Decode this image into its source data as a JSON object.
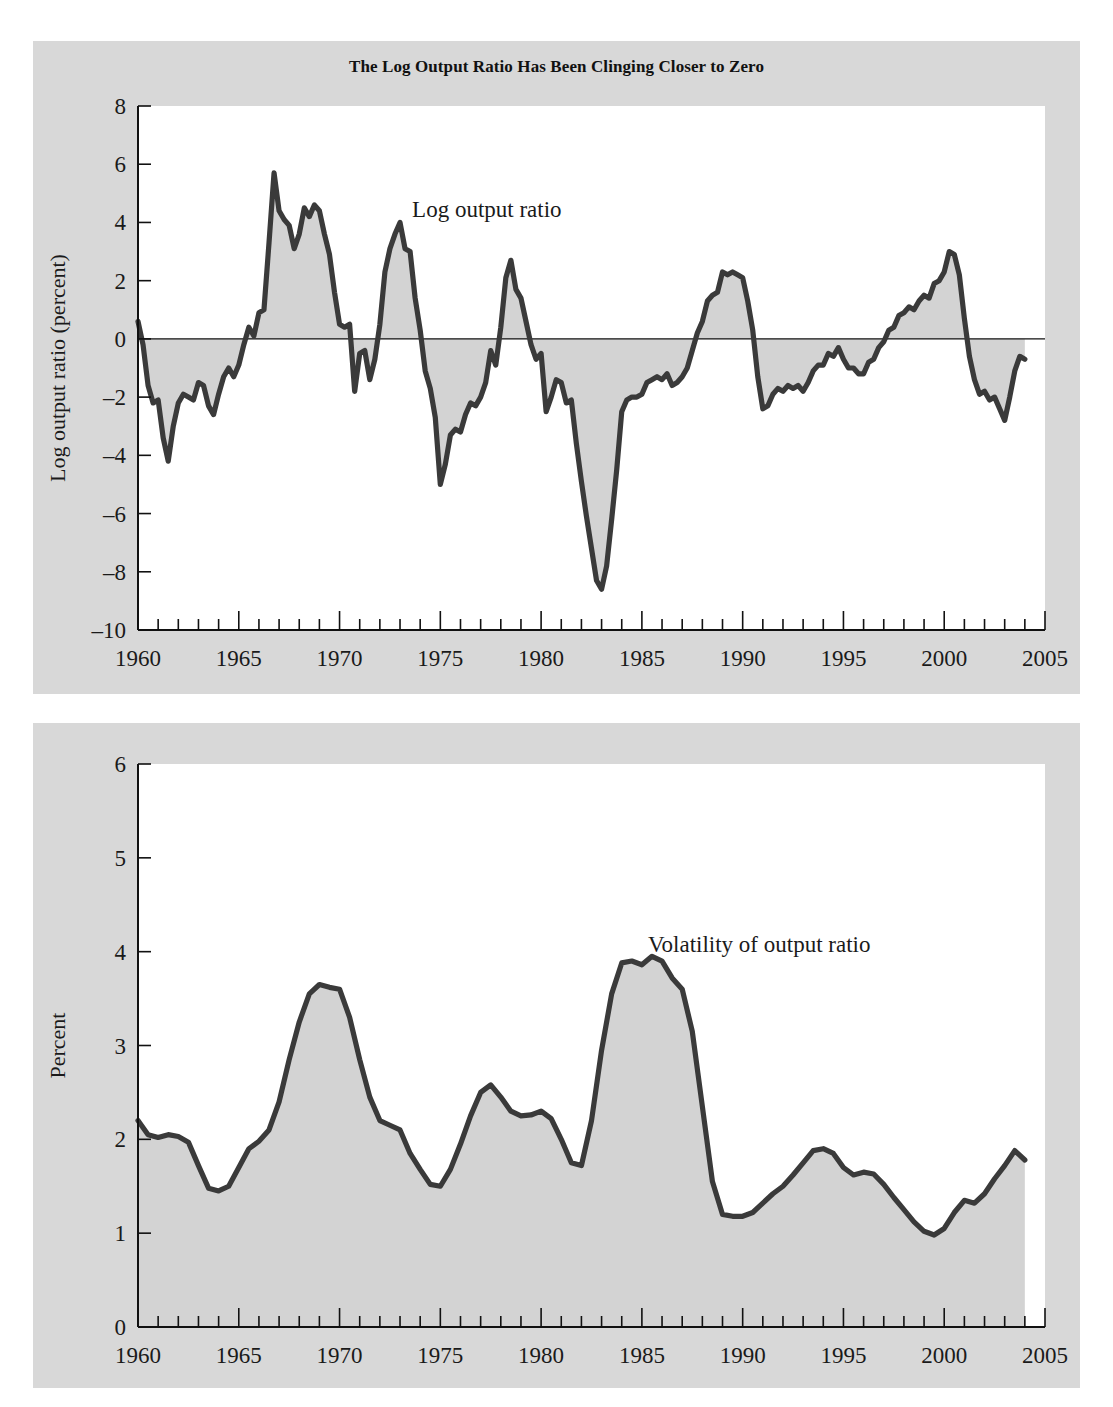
{
  "figure": {
    "title": "The Log Output Ratio Has Been Clinging Closer to Zero",
    "background_color": "#d8d8d8",
    "plot_background_color": "#ffffff",
    "line_color": "#3a3a3a",
    "fill_color": "#d3d3d3"
  },
  "chart_data": [
    {
      "type": "area",
      "title": "The Log Output Ratio Has Been Clinging Closer to Zero",
      "xlabel": "",
      "ylabel": "Log output ratio (percent)",
      "xlim": [
        1960,
        2005
      ],
      "ylim": [
        -10,
        8
      ],
      "ytick_labels": [
        "8",
        "6",
        "4",
        "2",
        "0",
        "-2",
        "-4",
        "-6",
        "-8",
        "-10"
      ],
      "yticks": [
        8,
        6,
        4,
        2,
        0,
        -2,
        -4,
        -6,
        -8,
        -10
      ],
      "xtick_labels": [
        "1960",
        "1965",
        "1970",
        "1975",
        "1980",
        "1985",
        "1990",
        "1995",
        "2000",
        "2005"
      ],
      "xticks": [
        1960,
        1965,
        1970,
        1975,
        1980,
        1985,
        1990,
        1995,
        2000,
        2005
      ],
      "minor_xtick_interval": 1,
      "grid": false,
      "legend": "none",
      "annotations": [
        {
          "text": "Log output ratio",
          "x": 1973.6,
          "y": 4.2
        }
      ],
      "baseline": 0,
      "series": [
        {
          "name": "Log output ratio",
          "x": [
            1960.0,
            1960.25,
            1960.5,
            1960.75,
            1961.0,
            1961.25,
            1961.5,
            1961.75,
            1962.0,
            1962.25,
            1962.5,
            1962.75,
            1963.0,
            1963.25,
            1963.5,
            1963.75,
            1964.0,
            1964.25,
            1964.5,
            1964.75,
            1965.0,
            1965.25,
            1965.5,
            1965.75,
            1966.0,
            1966.25,
            1966.5,
            1966.75,
            1967.0,
            1967.25,
            1967.5,
            1967.75,
            1968.0,
            1968.25,
            1968.5,
            1968.75,
            1969.0,
            1969.25,
            1969.5,
            1969.75,
            1970.0,
            1970.25,
            1970.5,
            1970.75,
            1971.0,
            1971.25,
            1971.5,
            1971.75,
            1972.0,
            1972.25,
            1972.5,
            1972.75,
            1973.0,
            1973.25,
            1973.5,
            1973.75,
            1974.0,
            1974.25,
            1974.5,
            1974.75,
            1975.0,
            1975.25,
            1975.5,
            1975.75,
            1976.0,
            1976.25,
            1976.5,
            1976.75,
            1977.0,
            1977.25,
            1977.5,
            1977.75,
            1978.0,
            1978.25,
            1978.5,
            1978.75,
            1979.0,
            1979.25,
            1979.5,
            1979.75,
            1980.0,
            1980.25,
            1980.5,
            1980.75,
            1981.0,
            1981.25,
            1981.5,
            1981.75,
            1982.0,
            1982.25,
            1982.5,
            1982.75,
            1983.0,
            1983.25,
            1983.5,
            1983.75,
            1984.0,
            1984.25,
            1984.5,
            1984.75,
            1985.0,
            1985.25,
            1985.5,
            1985.75,
            1986.0,
            1986.25,
            1986.5,
            1986.75,
            1987.0,
            1987.25,
            1987.5,
            1987.75,
            1988.0,
            1988.25,
            1988.5,
            1988.75,
            1989.0,
            1989.25,
            1989.5,
            1989.75,
            1990.0,
            1990.25,
            1990.5,
            1990.75,
            1991.0,
            1991.25,
            1991.5,
            1991.75,
            1992.0,
            1992.25,
            1992.5,
            1992.75,
            1993.0,
            1993.25,
            1993.5,
            1993.75,
            1994.0,
            1994.25,
            1994.5,
            1994.75,
            1995.0,
            1995.25,
            1995.5,
            1995.75,
            1996.0,
            1996.25,
            1996.5,
            1996.75,
            1997.0,
            1997.25,
            1997.5,
            1997.75,
            1998.0,
            1998.25,
            1998.5,
            1998.75,
            1999.0,
            1999.25,
            1999.5,
            1999.75,
            2000.0,
            2000.25,
            2000.5,
            2000.75,
            2001.0,
            2001.25,
            2001.5,
            2001.75,
            2002.0,
            2002.25,
            2002.5,
            2002.75,
            2003.0,
            2003.25,
            2003.5,
            2003.75,
            2004.0
          ],
          "y": [
            0.6,
            -0.2,
            -1.6,
            -2.2,
            -2.1,
            -3.4,
            -4.2,
            -3.0,
            -2.2,
            -1.9,
            -2.0,
            -2.1,
            -1.5,
            -1.6,
            -2.3,
            -2.6,
            -1.9,
            -1.3,
            -1.0,
            -1.3,
            -0.9,
            -0.2,
            0.4,
            0.1,
            0.9,
            1.0,
            3.3,
            5.7,
            4.4,
            4.1,
            3.9,
            3.1,
            3.6,
            4.5,
            4.2,
            4.6,
            4.4,
            3.6,
            2.9,
            1.6,
            0.5,
            0.4,
            0.5,
            -1.8,
            -0.5,
            -0.4,
            -1.4,
            -0.7,
            0.5,
            2.3,
            3.1,
            3.6,
            4.0,
            3.1,
            3.0,
            1.4,
            0.3,
            -1.1,
            -1.7,
            -2.7,
            -5.0,
            -4.3,
            -3.3,
            -3.1,
            -3.2,
            -2.6,
            -2.2,
            -2.3,
            -2.0,
            -1.5,
            -0.4,
            -0.9,
            0.4,
            2.1,
            2.7,
            1.7,
            1.4,
            0.6,
            -0.2,
            -0.7,
            -0.5,
            -2.5,
            -2.0,
            -1.4,
            -1.5,
            -2.2,
            -2.1,
            -3.6,
            -4.9,
            -6.1,
            -7.2,
            -8.3,
            -8.6,
            -7.8,
            -6.2,
            -4.5,
            -2.5,
            -2.1,
            -2.0,
            -2.0,
            -1.9,
            -1.5,
            -1.4,
            -1.3,
            -1.4,
            -1.2,
            -1.6,
            -1.5,
            -1.3,
            -1.0,
            -0.4,
            0.2,
            0.6,
            1.3,
            1.5,
            1.6,
            2.3,
            2.2,
            2.3,
            2.2,
            2.1,
            1.3,
            0.3,
            -1.3,
            -2.4,
            -2.3,
            -1.9,
            -1.7,
            -1.8,
            -1.6,
            -1.7,
            -1.6,
            -1.8,
            -1.5,
            -1.1,
            -0.9,
            -0.9,
            -0.5,
            -0.6,
            -0.3,
            -0.7,
            -1.0,
            -1.0,
            -1.2,
            -1.2,
            -0.8,
            -0.7,
            -0.3,
            -0.1,
            0.3,
            0.4,
            0.8,
            0.9,
            1.1,
            1.0,
            1.3,
            1.5,
            1.4,
            1.9,
            2.0,
            2.3,
            3.0,
            2.9,
            2.2,
            0.7,
            -0.6,
            -1.4,
            -1.9,
            -1.8,
            -2.1,
            -2.0,
            -2.4,
            -2.8,
            -2.0,
            -1.1,
            -0.6,
            -0.7
          ]
        }
      ]
    },
    {
      "type": "area",
      "title": "",
      "xlabel": "",
      "ylabel": "Percent",
      "xlim": [
        1960,
        2005
      ],
      "ylim": [
        0,
        6
      ],
      "ytick_labels": [
        "6",
        "5",
        "4",
        "3",
        "2",
        "1",
        "0"
      ],
      "yticks": [
        6,
        5,
        4,
        3,
        2,
        1,
        0
      ],
      "xtick_labels": [
        "1960",
        "1965",
        "1970",
        "1975",
        "1980",
        "1985",
        "1990",
        "1995",
        "2000",
        "2005"
      ],
      "xticks": [
        1960,
        1965,
        1970,
        1975,
        1980,
        1985,
        1990,
        1995,
        2000,
        2005
      ],
      "minor_xtick_interval": 1,
      "grid": false,
      "legend": "none",
      "annotations": [
        {
          "text": "Volatility of output ratio",
          "x": 1985.3,
          "y": 4.0
        }
      ],
      "baseline": 0,
      "series": [
        {
          "name": "Volatility of output ratio",
          "x": [
            1960.0,
            1960.5,
            1961.0,
            1961.5,
            1962.0,
            1962.5,
            1963.0,
            1963.5,
            1964.0,
            1964.5,
            1965.0,
            1965.5,
            1966.0,
            1966.5,
            1967.0,
            1967.5,
            1968.0,
            1968.5,
            1969.0,
            1969.5,
            1970.0,
            1970.5,
            1971.0,
            1971.5,
            1972.0,
            1972.5,
            1973.0,
            1973.5,
            1974.0,
            1974.5,
            1975.0,
            1975.5,
            1976.0,
            1976.5,
            1977.0,
            1977.5,
            1978.0,
            1978.5,
            1979.0,
            1979.5,
            1980.0,
            1980.5,
            1981.0,
            1981.5,
            1982.0,
            1982.5,
            1983.0,
            1983.5,
            1984.0,
            1984.5,
            1985.0,
            1985.5,
            1986.0,
            1986.5,
            1987.0,
            1987.5,
            1988.0,
            1988.5,
            1989.0,
            1989.5,
            1990.0,
            1990.5,
            1991.0,
            1991.5,
            1992.0,
            1992.5,
            1993.0,
            1993.5,
            1994.0,
            1994.5,
            1995.0,
            1995.5,
            1996.0,
            1996.5,
            1997.0,
            1997.5,
            1998.0,
            1998.5,
            1999.0,
            1999.5,
            2000.0,
            2000.5,
            2001.0,
            2001.5,
            2002.0,
            2002.5,
            2003.0,
            2003.5,
            2004.0
          ],
          "y": [
            2.2,
            2.05,
            2.02,
            2.05,
            2.03,
            1.97,
            1.72,
            1.48,
            1.45,
            1.5,
            1.7,
            1.9,
            1.98,
            2.1,
            2.4,
            2.85,
            3.25,
            3.55,
            3.65,
            3.62,
            3.6,
            3.3,
            2.85,
            2.45,
            2.2,
            2.15,
            2.1,
            1.85,
            1.68,
            1.52,
            1.5,
            1.68,
            1.95,
            2.25,
            2.5,
            2.58,
            2.45,
            2.3,
            2.25,
            2.26,
            2.3,
            2.22,
            2.0,
            1.75,
            1.72,
            2.2,
            2.95,
            3.55,
            3.88,
            3.9,
            3.86,
            3.95,
            3.9,
            3.72,
            3.6,
            3.15,
            2.35,
            1.55,
            1.2,
            1.18,
            1.18,
            1.22,
            1.32,
            1.42,
            1.5,
            1.62,
            1.75,
            1.88,
            1.9,
            1.85,
            1.7,
            1.62,
            1.65,
            1.63,
            1.52,
            1.38,
            1.25,
            1.12,
            1.02,
            0.98,
            1.05,
            1.22,
            1.35,
            1.32,
            1.42,
            1.58,
            1.72,
            1.88,
            1.78
          ]
        }
      ]
    }
  ]
}
